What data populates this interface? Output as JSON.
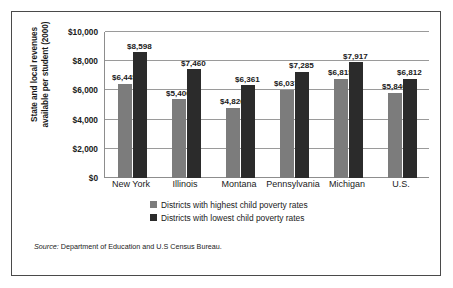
{
  "chart_data": {
    "type": "bar",
    "title": "",
    "xlabel": "",
    "ylabel": "State and local revenues available per student (2000)",
    "ylabel_line1": "State and local revenues",
    "ylabel_line2": "available per student (2000)",
    "categories": [
      "New York",
      "Illinois",
      "Montana",
      "Pennsylvania",
      "Michigan",
      "U.S."
    ],
    "ylim": [
      0,
      10000
    ],
    "ytick_values": [
      0,
      2000,
      4000,
      6000,
      8000,
      10000
    ],
    "ytick_labels": [
      "$0",
      "$2,000",
      "$4,000",
      "$6,000",
      "$8,000",
      "$10,000"
    ],
    "grid": true,
    "legend_position": "bottom",
    "series": [
      {
        "name": "Districts with highest child poverty rates",
        "color": "#7c7c7c",
        "values": [
          6445,
          5400,
          4826,
          6037,
          6815,
          5846
        ],
        "labels": [
          "$6,445",
          "$5,400",
          "$4,826",
          "$6,037",
          "$6,815",
          "$5,846"
        ]
      },
      {
        "name": "Districts with lowest child poverty rates",
        "color": "#2b2b2b",
        "values": [
          8598,
          7460,
          6361,
          7285,
          7917,
          6812
        ],
        "labels": [
          "$8,598",
          "$7,460",
          "$6,361",
          "$7,285",
          "$7,917",
          "$6,812"
        ]
      }
    ]
  },
  "source": {
    "label": "Source:",
    "text": "Department of Education and U.S Census Bureau."
  }
}
